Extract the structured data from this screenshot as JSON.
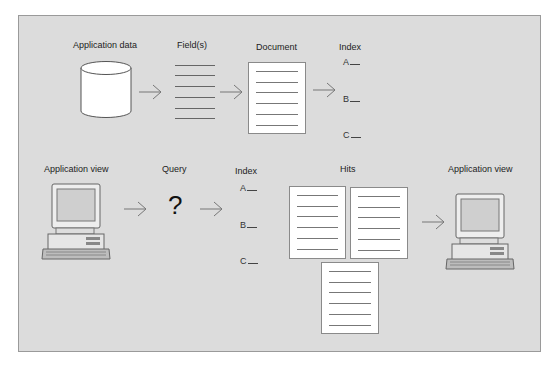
{
  "top_row": {
    "labels": {
      "app_data": "Application data",
      "fields": "Field(s)",
      "document": "Document",
      "index": "Index"
    },
    "index_entries": [
      "A",
      "B",
      "C"
    ]
  },
  "bottom_row": {
    "labels": {
      "app_view_left": "Application view",
      "query": "Query",
      "index": "Index",
      "hits": "Hits",
      "app_view_right": "Application view"
    },
    "query_symbol": "?",
    "index_entries": [
      "A",
      "B",
      "C"
    ]
  },
  "colors": {
    "background": "#dcdcdc",
    "frame_border": "#9a9a9a",
    "document_fill": "#ffffff",
    "line": "#777777"
  }
}
